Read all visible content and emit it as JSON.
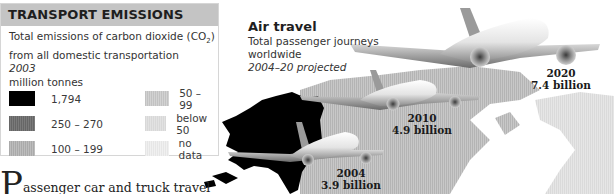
{
  "legend": {
    "title": "TRANSPORT EMISSIONS",
    "description_line1": "Total emissions of carbon dioxide (CO",
    "description_sub": "2",
    "description_line1_end": ")",
    "description_line2": "from all domestic transportation",
    "year": "2003",
    "unit": "million tonnes",
    "items": [
      {
        "label": "1,794",
        "color": "#000000"
      },
      {
        "label": "250 – 270",
        "color": "#6e6e6e"
      },
      {
        "label": "100 – 199",
        "color": "#b3b3b3"
      },
      {
        "label": "50 – 99",
        "color": "#c9c9c9"
      },
      {
        "label": "below 50",
        "color": "#dcdcdc"
      },
      {
        "label": "no data",
        "color": "#ececec"
      }
    ]
  },
  "air_travel": {
    "title": "Air travel",
    "subtitle_line1": "Total passenger journeys",
    "subtitle_line2": "worldwide",
    "note": "2004–20 projected",
    "data_points": [
      {
        "year": "2004",
        "value": "3.9 billion"
      },
      {
        "year": "2010",
        "value": "4.9 billion"
      },
      {
        "year": "2020",
        "value": "7.4 billion"
      }
    ]
  },
  "body": {
    "dropcap": "P",
    "text": "assenger car and truck travel"
  }
}
